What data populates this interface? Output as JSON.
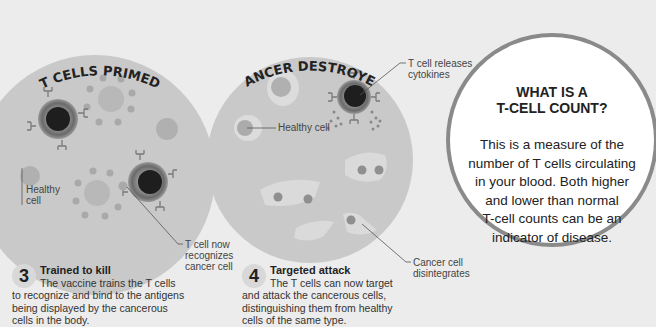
{
  "panels": [
    {
      "title": "T CELLS PRIMED",
      "labels": {
        "healthy_cell": [
          "Healthy",
          "cell"
        ],
        "t_cell_recognizes": [
          "T cell now",
          "recognizes",
          "cancer cell"
        ]
      },
      "step": {
        "number": "3",
        "title": "Trained to kill",
        "lines": [
          "The vaccine trains the T cells",
          "to recognize and bind to the antigens",
          "being displayed by the cancerous",
          "cells in the body."
        ]
      }
    },
    {
      "title": "CANCER DESTROYED",
      "labels": {
        "t_cell_releases": [
          "T cell releases",
          "cytokines"
        ],
        "healthy_cell": "Healthy cell",
        "cancer_disintegrates": [
          "Cancer cell",
          "disintegrates"
        ]
      },
      "step": {
        "number": "4",
        "title": "Targeted attack",
        "lines": [
          "The T cells can now target",
          "and attack the cancerous cells,",
          "distinguishing them from healthy",
          "cells of the same type."
        ]
      }
    }
  ],
  "info_box": {
    "heading": [
      "WHAT IS A",
      "T-CELL COUNT?"
    ],
    "body": [
      "This is a measure of the",
      "number of T cells circulating",
      "in your blood. Both higher",
      "and lower than normal",
      "T-cell counts can be an",
      "indicator of disease."
    ]
  },
  "colors": {
    "background": "#ececec",
    "circle_fill": "#c9c9c9",
    "cell_light": "#b5b5b5",
    "t_cell_core": "#1e1e1e",
    "t_cell_ring": "#7a7a7a",
    "info_border": "#8a8a8a",
    "info_fill": "#ffffff"
  }
}
